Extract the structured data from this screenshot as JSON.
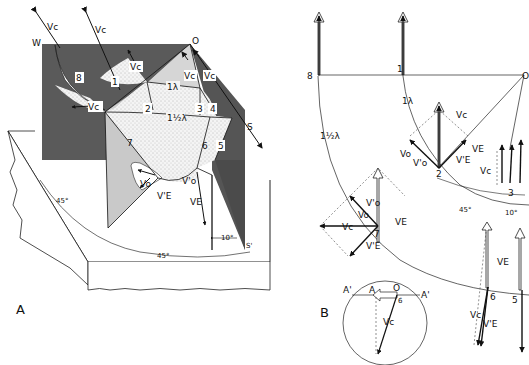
{
  "panel_a": {
    "label": "A",
    "corner_labels": {
      "w": "W",
      "o": "O",
      "s": "S",
      "s_prime": "S'"
    },
    "ray_labels": [
      "1",
      "2",
      "3",
      "4",
      "5",
      "6",
      "7",
      "8"
    ],
    "wavefront_labels": {
      "one": "1λ",
      "one_half": "1½λ"
    },
    "vector_labels": {
      "vc": "Vc",
      "vo": "Vo",
      "vo_prime": "V'o",
      "ve": "VE",
      "ve_prime": "V'E"
    },
    "angles": {
      "a45_left": "45°",
      "a45_bottom": "45°",
      "a10": "10°"
    }
  },
  "panel_b": {
    "label": "B",
    "point_labels": {
      "o": "O",
      "a": "A",
      "a_prime_left": "A'",
      "a_prime_right": "A'"
    },
    "ray_labels": [
      "8",
      "1",
      "2",
      "3",
      "5",
      "6",
      "7"
    ],
    "wavefront_labels": {
      "one": "1λ",
      "one_half": "1½λ"
    },
    "vector_labels": {
      "vc": "Vc",
      "vo": "Vo",
      "vo_prime": "V'o",
      "ve": "VE",
      "ve_prime": "V'E"
    },
    "angles": {
      "a45": "45°",
      "a10": "10°"
    },
    "inset_ray": "6"
  }
}
